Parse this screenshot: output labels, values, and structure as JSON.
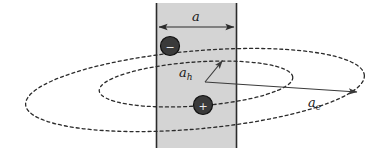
{
  "figure": {
    "background_color": "#ffffff",
    "slab": {
      "name": "quantum-well-slab",
      "fill_color": "#d4d4d4",
      "edge_color": "#2b2b2b",
      "x": 156,
      "y": 3,
      "width": 81,
      "height": 145
    },
    "width_dimension": {
      "label": "a",
      "label_x": 196,
      "label_y": 20,
      "arrow_y": 27,
      "arrow_x1": 158,
      "arrow_x2": 235,
      "color": "#1a1a1a"
    },
    "particles": [
      {
        "name": "electron-particle",
        "charge_symbol": "−",
        "cx": 170,
        "cy": 46,
        "r": 9.5,
        "fill_color": "#3a3a3a",
        "edge_color": "#111111",
        "symbol_color": "#e8e8e8"
      },
      {
        "name": "hole-particle",
        "charge_symbol": "+",
        "cx": 203,
        "cy": 105,
        "r": 9.5,
        "fill_color": "#3a3a3a",
        "edge_color": "#111111",
        "symbol_color": "#e8e8e8"
      }
    ],
    "ellipses": [
      {
        "name": "outer-orbit-ellipse",
        "cx": 195,
        "cy": 90,
        "rx": 170,
        "ry": 39,
        "rotation_deg": -5,
        "stroke_color": "#2b2b2b",
        "dash": "3 3"
      },
      {
        "name": "inner-orbit-ellipse",
        "cx": 196,
        "cy": 84,
        "rx": 97,
        "ry": 22,
        "rotation_deg": -4,
        "stroke_color": "#2b2b2b",
        "dash": "3 3"
      }
    ],
    "radius_arrows": [
      {
        "name": "hole-radius-arrow",
        "label": "a",
        "subscript": "h",
        "label_x": 183,
        "label_y": 75,
        "x1": 205,
        "y1": 82,
        "x2": 223,
        "y2": 60,
        "color": "#3a3a3a"
      },
      {
        "name": "electron-radius-arrow",
        "label": "a",
        "subscript": "e",
        "label_x": 312,
        "label_y": 104,
        "x1": 205,
        "y1": 82,
        "x2": 358,
        "y2": 92,
        "color": "#3a3a3a"
      }
    ]
  }
}
